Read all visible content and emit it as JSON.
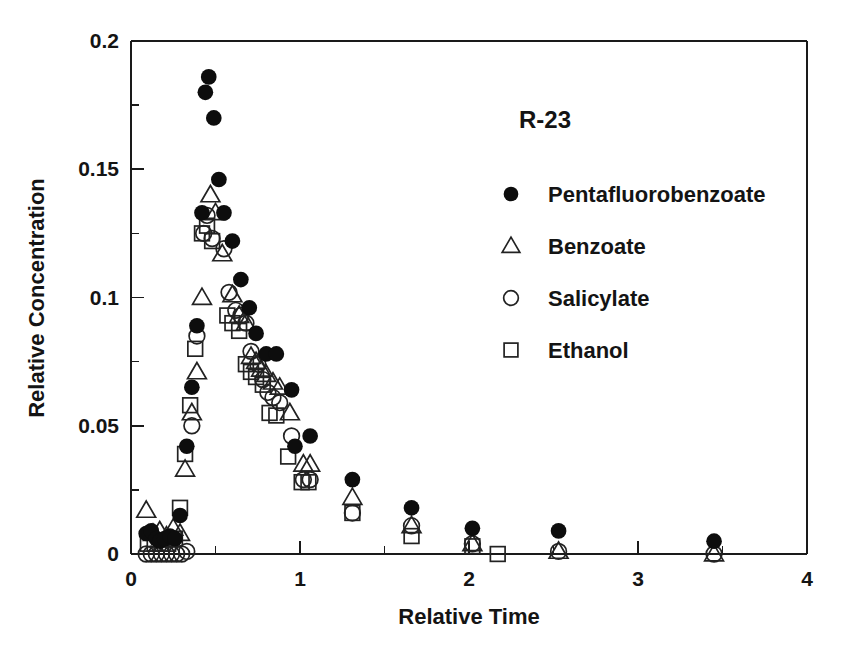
{
  "chart_data": {
    "type": "scatter",
    "title": "R-23",
    "xlabel": "Relative Time",
    "ylabel": "Relative Concentration",
    "xlim": [
      0,
      4
    ],
    "ylim": [
      0,
      0.2
    ],
    "xticks": [
      "0",
      "1",
      "2",
      "3",
      "4"
    ],
    "xtick_values": [
      0,
      1,
      2,
      3,
      4
    ],
    "xminor_values": [
      0.5,
      1.5,
      2.5,
      3.5
    ],
    "yticks": [
      "0",
      "0.05",
      "0.1",
      "0.15",
      "0.2"
    ],
    "ytick_values": [
      0,
      0.05,
      0.1,
      0.15,
      0.2
    ],
    "yminor_values": [
      0.025,
      0.075,
      0.125,
      0.175
    ],
    "grid": false,
    "legend_position": "upper-right-inside",
    "series": [
      {
        "name": "Pentafluorobenzoate",
        "marker": "filled-circle",
        "color": "#0d0d0d",
        "points": [
          [
            0.09,
            0.008
          ],
          [
            0.12,
            0.009
          ],
          [
            0.15,
            0.006
          ],
          [
            0.17,
            0.005
          ],
          [
            0.2,
            0.006
          ],
          [
            0.23,
            0.007
          ],
          [
            0.26,
            0.006
          ],
          [
            0.29,
            0.015
          ],
          [
            0.33,
            0.042
          ],
          [
            0.36,
            0.065
          ],
          [
            0.39,
            0.089
          ],
          [
            0.42,
            0.133
          ],
          [
            0.44,
            0.18
          ],
          [
            0.46,
            0.186
          ],
          [
            0.49,
            0.17
          ],
          [
            0.52,
            0.146
          ],
          [
            0.55,
            0.133
          ],
          [
            0.6,
            0.122
          ],
          [
            0.65,
            0.107
          ],
          [
            0.7,
            0.096
          ],
          [
            0.74,
            0.086
          ],
          [
            0.8,
            0.078
          ],
          [
            0.86,
            0.078
          ],
          [
            0.95,
            0.064
          ],
          [
            0.97,
            0.042
          ],
          [
            1.06,
            0.046
          ],
          [
            1.31,
            0.029
          ],
          [
            1.66,
            0.018
          ],
          [
            2.02,
            0.01
          ],
          [
            2.53,
            0.009
          ],
          [
            3.45,
            0.005
          ]
        ]
      },
      {
        "name": "Benzoate",
        "marker": "open-triangle",
        "color": "#222222",
        "points": [
          [
            0.09,
            0.017
          ],
          [
            0.13,
            0.008
          ],
          [
            0.17,
            0.009
          ],
          [
            0.21,
            0.007
          ],
          [
            0.25,
            0.01
          ],
          [
            0.29,
            0.008
          ],
          [
            0.32,
            0.033
          ],
          [
            0.36,
            0.055
          ],
          [
            0.39,
            0.071
          ],
          [
            0.42,
            0.1
          ],
          [
            0.47,
            0.14
          ],
          [
            0.5,
            0.133
          ],
          [
            0.54,
            0.117
          ],
          [
            0.6,
            0.101
          ],
          [
            0.64,
            0.093
          ],
          [
            0.68,
            0.09
          ],
          [
            0.71,
            0.077
          ],
          [
            0.74,
            0.075
          ],
          [
            0.77,
            0.072
          ],
          [
            0.8,
            0.07
          ],
          [
            0.84,
            0.067
          ],
          [
            0.88,
            0.065
          ],
          [
            0.94,
            0.055
          ],
          [
            1.02,
            0.035
          ],
          [
            1.06,
            0.035
          ],
          [
            1.31,
            0.022
          ],
          [
            1.66,
            0.011
          ],
          [
            2.02,
            0.004
          ],
          [
            2.53,
            0.001
          ],
          [
            3.45,
            0.0
          ]
        ]
      },
      {
        "name": "Salicylate",
        "marker": "open-circle",
        "color": "#222222",
        "points": [
          [
            0.09,
            0.0
          ],
          [
            0.12,
            0.0
          ],
          [
            0.15,
            0.0
          ],
          [
            0.18,
            0.0
          ],
          [
            0.21,
            0.0
          ],
          [
            0.24,
            0.0
          ],
          [
            0.27,
            0.0
          ],
          [
            0.3,
            0.0
          ],
          [
            0.33,
            0.001
          ],
          [
            0.36,
            0.05
          ],
          [
            0.39,
            0.085
          ],
          [
            0.43,
            0.125
          ],
          [
            0.45,
            0.132
          ],
          [
            0.48,
            0.123
          ],
          [
            0.55,
            0.119
          ],
          [
            0.58,
            0.102
          ],
          [
            0.62,
            0.095
          ],
          [
            0.65,
            0.093
          ],
          [
            0.68,
            0.09
          ],
          [
            0.71,
            0.079
          ],
          [
            0.75,
            0.074
          ],
          [
            0.78,
            0.068
          ],
          [
            0.81,
            0.063
          ],
          [
            0.84,
            0.061
          ],
          [
            0.88,
            0.059
          ],
          [
            0.95,
            0.046
          ],
          [
            1.02,
            0.029
          ],
          [
            1.06,
            0.029
          ],
          [
            1.31,
            0.016
          ],
          [
            1.66,
            0.011
          ],
          [
            2.02,
            0.004
          ],
          [
            2.53,
            0.001
          ],
          [
            3.45,
            0.0
          ]
        ]
      },
      {
        "name": "Ethanol",
        "marker": "open-square",
        "color": "#222222",
        "points": [
          [
            0.1,
            0.004
          ],
          [
            0.14,
            0.004
          ],
          [
            0.18,
            0.004
          ],
          [
            0.22,
            0.004
          ],
          [
            0.26,
            0.006
          ],
          [
            0.29,
            0.018
          ],
          [
            0.32,
            0.039
          ],
          [
            0.35,
            0.058
          ],
          [
            0.38,
            0.08
          ],
          [
            0.42,
            0.125
          ],
          [
            0.45,
            0.128
          ],
          [
            0.48,
            0.122
          ],
          [
            0.57,
            0.093
          ],
          [
            0.6,
            0.09
          ],
          [
            0.64,
            0.087
          ],
          [
            0.68,
            0.074
          ],
          [
            0.71,
            0.071
          ],
          [
            0.74,
            0.069
          ],
          [
            0.78,
            0.066
          ],
          [
            0.82,
            0.055
          ],
          [
            0.86,
            0.054
          ],
          [
            0.93,
            0.038
          ],
          [
            1.01,
            0.028
          ],
          [
            1.05,
            0.028
          ],
          [
            1.31,
            0.016
          ],
          [
            1.66,
            0.007
          ],
          [
            2.02,
            0.003
          ],
          [
            2.17,
            0.0
          ]
        ]
      }
    ]
  },
  "legend": {
    "title": "R-23",
    "entries": [
      {
        "label": "Pentafluorobenzoate",
        "marker": "filled-circle"
      },
      {
        "label": "Benzoate",
        "marker": "open-triangle"
      },
      {
        "label": "Salicylate",
        "marker": "open-circle"
      },
      {
        "label": "Ethanol",
        "marker": "open-square"
      }
    ]
  }
}
